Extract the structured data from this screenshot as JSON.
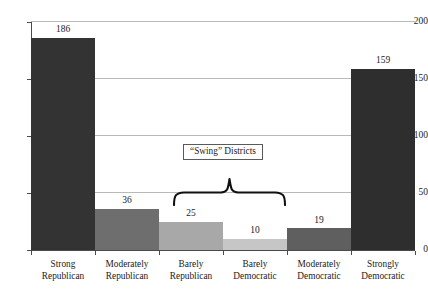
{
  "chart_data": {
    "type": "bar",
    "title": "",
    "subtitle": "",
    "xlabel": "",
    "ylabel": "",
    "categories": [
      "Strong Republican",
      "Moderately Republican",
      "Barely Republican",
      "Barely Democratic",
      "Moderately Democratic",
      "Strongly Democratic"
    ],
    "category_lines": [
      [
        "Strong",
        "Republican"
      ],
      [
        "Moderately",
        "Republican"
      ],
      [
        "Barely",
        "Republican"
      ],
      [
        "Barely",
        "Democratic"
      ],
      [
        "Moderately",
        "Democratic"
      ],
      [
        "Strongly",
        "Democratic"
      ]
    ],
    "values": [
      186,
      36,
      25,
      10,
      19,
      159
    ],
    "bar_colors": [
      "#333333",
      "#6e6e6e",
      "#a8a8a8",
      "#c6c6c6",
      "#5f5f5f",
      "#2e2e2e"
    ],
    "ylim": [
      0,
      200
    ],
    "yticks": [
      0,
      50,
      100,
      150,
      200
    ],
    "ytick_labels": [
      "0",
      "50",
      "100",
      "150",
      "200"
    ],
    "grid": true,
    "grid_color": "#b9b9b9",
    "legend": "none",
    "annotations": [
      {
        "text": "“Swing” Districts",
        "spans_categories": [
          "Barely Republican",
          "Barely Democratic"
        ],
        "marker": "curly-brace"
      }
    ]
  },
  "axis": {
    "y_tick_0": "0",
    "y_tick_1": "50",
    "y_tick_2": "100",
    "y_tick_3": "150",
    "y_tick_4": "200"
  },
  "bars": [
    {
      "label_line1": "Strong",
      "label_line2": "Republican",
      "value_label": "186"
    },
    {
      "label_line1": "Moderately",
      "label_line2": "Republican",
      "value_label": "36"
    },
    {
      "label_line1": "Barely",
      "label_line2": "Republican",
      "value_label": "25"
    },
    {
      "label_line1": "Barely",
      "label_line2": "Democratic",
      "value_label": "10"
    },
    {
      "label_line1": "Moderately",
      "label_line2": "Democratic",
      "value_label": "19"
    },
    {
      "label_line1": "Strongly",
      "label_line2": "Democratic",
      "value_label": "159"
    }
  ],
  "annotation": {
    "swing_label": "“Swing” Districts"
  }
}
